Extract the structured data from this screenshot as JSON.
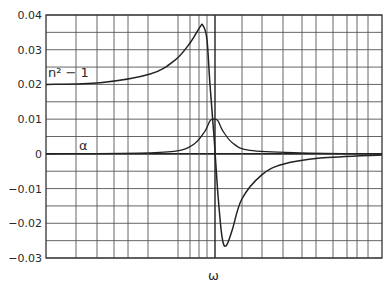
{
  "chart_data": {
    "type": "line",
    "title": "",
    "xlabel": "ω",
    "ylabel": "",
    "xlim": [
      0,
      1
    ],
    "ylim": [
      -0.03,
      0.04
    ],
    "grid": true,
    "legend": null,
    "yticks": [
      0.04,
      0.03,
      0.02,
      0.01,
      0,
      -0.01,
      -0.02,
      -0.03
    ],
    "ytick_labels": [
      "0.04",
      "0.03",
      "0.02",
      "0.01",
      "0",
      "−0.01",
      "−0.02",
      "−0.03"
    ],
    "xtick_labels": [],
    "annotations": [
      {
        "text": "n² − 1",
        "series": "n² − 1"
      },
      {
        "text": "α",
        "series": "α"
      }
    ],
    "series": [
      {
        "name": "n² − 1",
        "x": [
          0.0,
          0.161,
          0.31,
          0.384,
          0.429,
          0.458,
          0.467,
          0.479,
          0.488,
          0.5,
          0.512,
          0.524,
          0.536,
          0.554,
          0.583,
          0.643,
          0.705,
          0.816,
          1.0
        ],
        "y": [
          0.02,
          0.0205,
          0.023,
          0.027,
          0.032,
          0.0365,
          0.037,
          0.033,
          0.02,
          0.005,
          -0.012,
          -0.024,
          -0.0265,
          -0.022,
          -0.013,
          -0.006,
          -0.003,
          -0.0012,
          -0.0003
        ]
      },
      {
        "name": "α",
        "x": [
          0.0,
          0.31,
          0.399,
          0.443,
          0.473,
          0.488,
          0.5,
          0.512,
          0.527,
          0.557,
          0.607,
          0.756,
          1.0
        ],
        "y": [
          0.0,
          0.0003,
          0.001,
          0.003,
          0.0065,
          0.0095,
          0.01,
          0.0095,
          0.0065,
          0.003,
          0.001,
          0.0003,
          0.0
        ]
      }
    ]
  },
  "labels": {
    "n_curve": "n² − 1",
    "alpha_curve": "α",
    "x_axis": "ω"
  }
}
